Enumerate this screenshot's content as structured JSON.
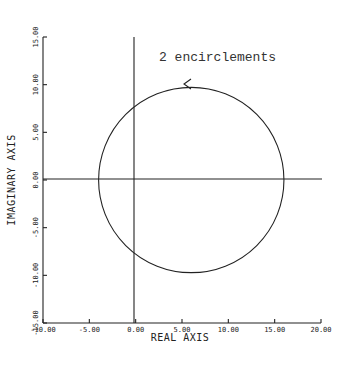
{
  "chart_data": {
    "type": "line",
    "title": "",
    "xlabel": "REAL AXIS",
    "ylabel": "IMAGINARY AXIS",
    "xlim": [
      -10,
      20
    ],
    "ylim": [
      -15,
      15
    ],
    "x_ticks": [
      -10,
      -5,
      0,
      5,
      10,
      15,
      20
    ],
    "x_tick_labels": [
      "-10.00",
      "-5.00",
      "0.00",
      "5.00",
      "10.00",
      "15.00",
      "20.00"
    ],
    "y_ticks": [
      -15,
      -10,
      -5,
      0,
      5,
      10,
      15
    ],
    "y_tick_labels": [
      "-15.00",
      "-10.00",
      "-5.00",
      "0.00",
      "5.00",
      "10.00",
      "15.00"
    ],
    "grid": false,
    "series": [
      {
        "name": "Nyquist contour",
        "shape": "circle",
        "center": [
          6,
          0
        ],
        "radius": 10,
        "direction": "counterclockwise arrow at top",
        "real_axis_crossings": [
          -4,
          16
        ],
        "imag_axis_crossings": [
          8,
          -8
        ]
      }
    ],
    "annotations": [
      {
        "text": "2 encirclements",
        "x": 7.5,
        "y": 12.5
      }
    ],
    "reference_lines": [
      {
        "type": "horizontal",
        "value": 0
      },
      {
        "type": "vertical",
        "value": 0
      }
    ]
  }
}
